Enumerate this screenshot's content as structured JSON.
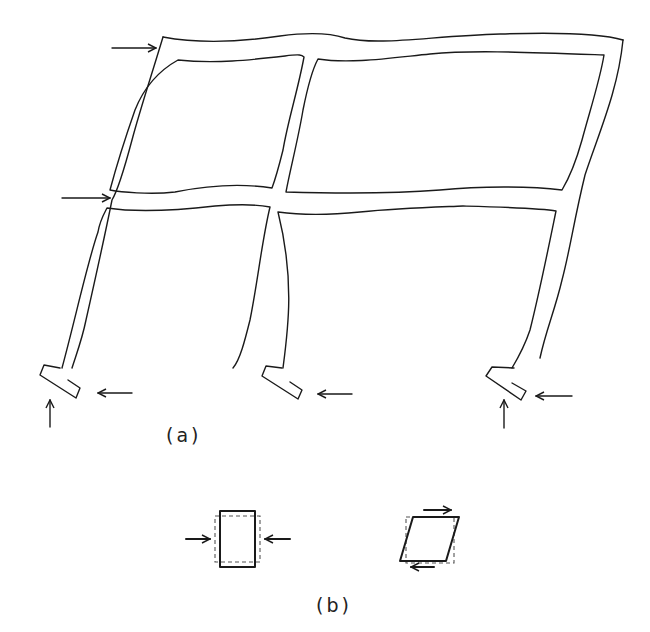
{
  "figure": {
    "panel_a": {
      "label": "(a)",
      "description": "Deformed two-bay, two-story frame under lateral loads with footings"
    },
    "panel_b": {
      "label": "(b)",
      "elements": [
        {
          "name": "compression-element",
          "description": "Element compressed by opposing horizontal forces"
        },
        {
          "name": "shear-element",
          "description": "Element deformed in shear by opposing tangential forces"
        }
      ]
    }
  }
}
